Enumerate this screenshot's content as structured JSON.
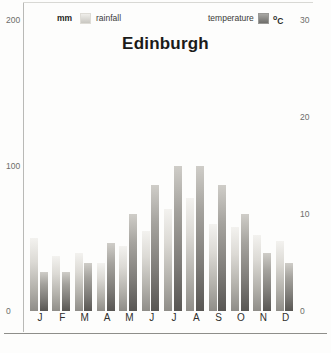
{
  "chart_data": {
    "type": "bar",
    "title": "Edinburgh",
    "categories": [
      "J",
      "F",
      "M",
      "A",
      "M",
      "J",
      "J",
      "A",
      "S",
      "O",
      "N",
      "D"
    ],
    "series": [
      {
        "name": "rainfall",
        "unit": "mm",
        "axis": "left",
        "values": [
          50,
          38,
          40,
          33,
          45,
          55,
          70,
          78,
          60,
          58,
          52,
          48
        ]
      },
      {
        "name": "temperature",
        "unit": "ºC",
        "axis": "right",
        "values": [
          4,
          4,
          5,
          7,
          10,
          13,
          15,
          15,
          13,
          10,
          6,
          5
        ]
      }
    ],
    "xlabel": "",
    "ylabel": "mm",
    "y2label": "ºC",
    "ylim": [
      0,
      200
    ],
    "y2lim": [
      0,
      30
    ],
    "yticks": [
      "200",
      "100",
      "0"
    ],
    "y2ticks": [
      "30",
      "20",
      "10",
      "0"
    ],
    "grid": false,
    "legend_position": "top"
  },
  "legend": {
    "rainfall_unit": "mm",
    "rainfall_label": "rainfall",
    "temperature_label": "temperature",
    "temperature_unit_sup": "o",
    "temperature_unit_base": "C"
  },
  "colors": {
    "rainfall_light": "#f3f2ef",
    "rainfall_dark": "#8f8d88",
    "temperature_light": "#cfcdc8",
    "temperature_dark": "#585653",
    "axis_text": "#6d6d6a",
    "title_text": "#1b1b1a",
    "background": "#fdfdfc"
  }
}
